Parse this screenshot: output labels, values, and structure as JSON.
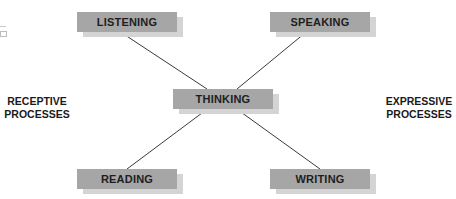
{
  "diagram": {
    "nodes": {
      "listening": {
        "label": "LISTENING"
      },
      "speaking": {
        "label": "SPEAKING"
      },
      "thinking": {
        "label": "THINKING"
      },
      "reading": {
        "label": "READING"
      },
      "writing": {
        "label": "WRITING"
      }
    },
    "edges": [
      {
        "from": "listening",
        "to": "thinking"
      },
      {
        "from": "speaking",
        "to": "thinking"
      },
      {
        "from": "thinking",
        "to": "reading"
      },
      {
        "from": "thinking",
        "to": "writing"
      }
    ],
    "side_labels": {
      "left": {
        "line1": "RECEPTIVE",
        "line2": "PROCESSES"
      },
      "right": {
        "line1": "EXPRESSIVE",
        "line2": "PROCESSES"
      }
    },
    "colors": {
      "box": "#a6a6a6",
      "shadow": "#d4d4d4",
      "line": "#3a3a3a",
      "text": "#1e1e1e"
    }
  }
}
